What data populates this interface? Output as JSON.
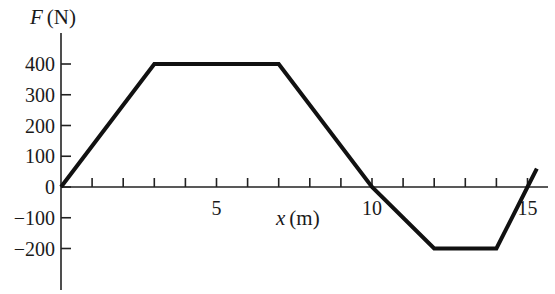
{
  "chart_data": {
    "type": "line",
    "title": "",
    "xlabel_var": "x",
    "xlabel_unit": "(m)",
    "ylabel_var": "F",
    "ylabel_unit": "(N)",
    "xlim": [
      0,
      15.5
    ],
    "ylim": [
      -300,
      500
    ],
    "grid": false,
    "x_ticks": [
      1,
      2,
      3,
      4,
      5,
      6,
      7,
      8,
      9,
      10,
      11,
      12,
      13,
      14,
      15
    ],
    "x_tick_labels": [
      {
        "x": 5,
        "label": "5"
      },
      {
        "x": 10,
        "label": "10"
      },
      {
        "x": 15,
        "label": "15"
      }
    ],
    "y_ticks": [
      400,
      300,
      200,
      100,
      0,
      -100,
      -200
    ],
    "y_tick_labels": [
      "400",
      "300",
      "200",
      "100",
      "0",
      "−100",
      "−200"
    ],
    "series": [
      {
        "name": "F(x)",
        "x": [
          0,
          3,
          7,
          10,
          12,
          14,
          15,
          15.3
        ],
        "y": [
          0,
          400,
          400,
          0,
          -200,
          -200,
          0,
          60
        ]
      }
    ]
  }
}
